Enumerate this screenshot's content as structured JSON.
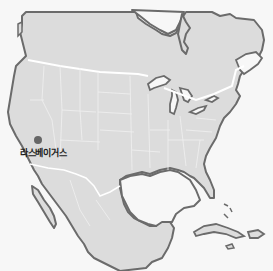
{
  "map": {
    "width": 273,
    "height": 271,
    "colors": {
      "water": "#f7f7f7",
      "land": "#dcdcdc",
      "coast": "#6b6b6b",
      "border_national": "#ffffff",
      "border_state": "#eeeeee",
      "marker": "#666666"
    },
    "markers": [
      {
        "name": "Las Vegas",
        "label": "라스베이거스",
        "x": 38,
        "y": 140,
        "label_x": 20,
        "label_y": 147
      }
    ]
  }
}
